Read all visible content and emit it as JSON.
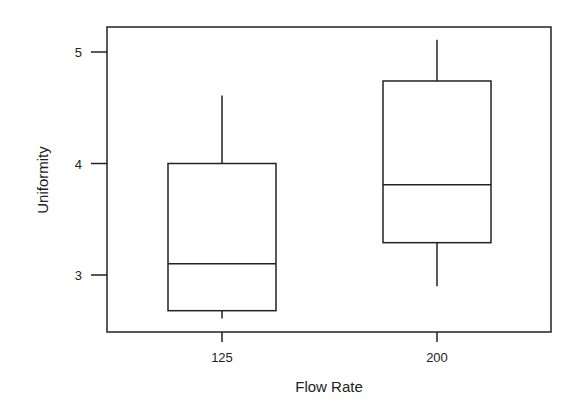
{
  "chart_data": {
    "type": "boxplot",
    "title": "",
    "xlabel": "Flow Rate",
    "ylabel": "Uniformity",
    "categories": [
      "125",
      "200"
    ],
    "boxes": [
      {
        "category": "125",
        "min": 2.61,
        "q1": 2.68,
        "median": 3.1,
        "q3": 4.0,
        "max": 4.61
      },
      {
        "category": "200",
        "min": 2.9,
        "q1": 3.29,
        "median": 3.81,
        "q3": 4.74,
        "max": 5.11
      }
    ],
    "yticks": [
      "3",
      "4",
      "5"
    ],
    "ylim": [
      2.48,
      5.23
    ],
    "grid": false,
    "legend": null
  },
  "axes": {
    "xlabel": "Flow Rate",
    "ylabel": "Uniformity",
    "xticks": [
      "125",
      "200"
    ],
    "yticks": [
      "3",
      "4",
      "5"
    ]
  }
}
